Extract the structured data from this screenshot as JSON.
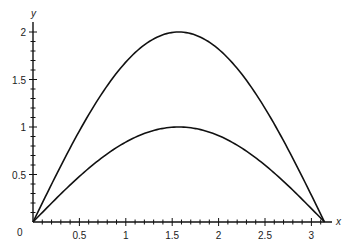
{
  "chart_data": {
    "type": "line",
    "title": "",
    "xlabel": "x",
    "ylabel": "y",
    "xlim": [
      0,
      3.14159
    ],
    "ylim": [
      0,
      2
    ],
    "grid": false,
    "legend": null,
    "x_ticks": [
      0.5,
      1,
      1.5,
      2,
      2.5,
      3
    ],
    "x_tick_labels": [
      "0.5",
      "1",
      "1.5",
      "2",
      "2.5",
      "3"
    ],
    "y_ticks": [
      0.5,
      1,
      1.5,
      2
    ],
    "y_tick_labels": [
      "0.5",
      "1",
      "1.5",
      "2"
    ],
    "origin_label": "0",
    "minor_ticks_per_major": 4,
    "series": [
      {
        "name": "2 sin(x)",
        "x": [
          0,
          0.3927,
          0.7854,
          1.1781,
          1.5708,
          1.9635,
          2.3562,
          2.7489,
          3.1416
        ],
        "values": [
          0,
          0.765,
          1.414,
          1.848,
          2.0,
          1.848,
          1.414,
          0.765,
          0
        ]
      },
      {
        "name": "sin(x)",
        "x": [
          0,
          0.3927,
          0.7854,
          1.1781,
          1.5708,
          1.9635,
          2.3562,
          2.7489,
          3.1416
        ],
        "values": [
          0,
          0.383,
          0.707,
          0.924,
          1.0,
          0.924,
          0.707,
          0.383,
          0
        ]
      }
    ]
  },
  "axes": {
    "x_label": "x",
    "y_label": "y",
    "origin_label": "0"
  }
}
